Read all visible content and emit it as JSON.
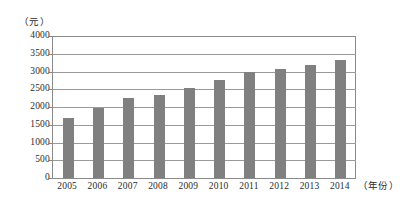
{
  "chart_data": {
    "type": "bar",
    "title": "",
    "subtitle": "",
    "xlabel": "（年份）",
    "ylabel": "（元）",
    "categories": [
      "2005",
      "2006",
      "2007",
      "2008",
      "2009",
      "2010",
      "2011",
      "2012",
      "2013",
      "2014"
    ],
    "values": [
      1690,
      1970,
      2250,
      2340,
      2540,
      2760,
      2990,
      3070,
      3180,
      3330
    ],
    "series": [
      {
        "name": "",
        "values": [
          1690,
          1970,
          2250,
          2340,
          2540,
          2760,
          2990,
          3070,
          3180,
          3330
        ]
      }
    ],
    "ylim": [
      0,
      4000
    ],
    "yticks": [
      0,
      500,
      1000,
      1500,
      2000,
      2500,
      3000,
      3500,
      4000
    ],
    "ytick_labels": [
      "0",
      "500",
      "1000",
      "1500",
      "2000",
      "2500",
      "3000",
      "3500",
      "4000"
    ],
    "grid": true,
    "grid_axis": "y",
    "legend": false,
    "legend_position": "none",
    "bar_color": "#808080",
    "axis_color": "#8a8a8a",
    "grid_color": "#9a9a9a",
    "background_color": "#ffffff"
  }
}
